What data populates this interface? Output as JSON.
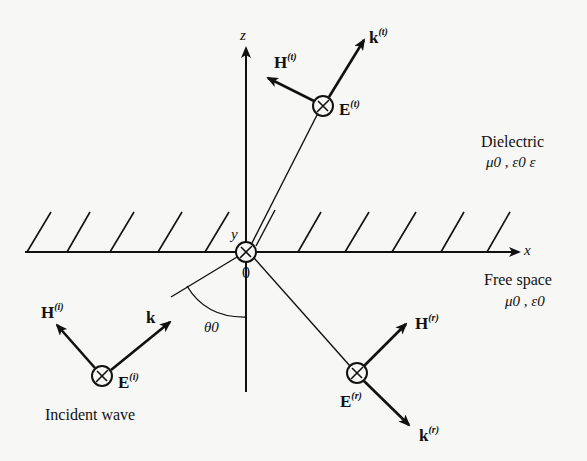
{
  "diagram": {
    "type": "plane wave reflection/transmission at dielectric interface",
    "axes": {
      "z_label": "z",
      "x_label": "x",
      "y_label": "y",
      "origin_label": "0"
    },
    "regions": {
      "upper": {
        "name": "Dielectric",
        "params": "μ0 , ε0 ε"
      },
      "lower": {
        "name": "Free space",
        "params": "μ0 , ε0"
      }
    },
    "angle_label": "θ0",
    "incident": {
      "caption": "Incident wave",
      "E": {
        "base": "E",
        "sup": "(i)"
      },
      "H": {
        "base": "H",
        "sup": "(i)"
      },
      "k": {
        "base": "k",
        "sup": ""
      }
    },
    "transmitted": {
      "E": {
        "base": "E",
        "sup": "(t)"
      },
      "H": {
        "base": "H",
        "sup": "(t)"
      },
      "k": {
        "base": "k",
        "sup": "(t)"
      }
    },
    "reflected": {
      "E": {
        "base": "E",
        "sup": "(r)"
      },
      "H": {
        "base": "H",
        "sup": "(r)"
      },
      "k": {
        "base": "k",
        "sup": "(r)"
      }
    },
    "colors": {
      "ink": "#111111",
      "paper": "#f7f7f5"
    }
  }
}
